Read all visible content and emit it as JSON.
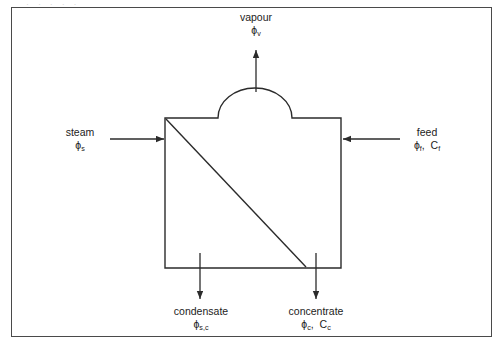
{
  "figure": {
    "clipped_caption_fragment": "·      ·        ·        ·    ·",
    "border_color": "#4a4a4a",
    "line_color": "#2b2b2b",
    "background": "#ffffff",
    "text_color": "#1c1c1c"
  },
  "diagram": {
    "type": "process-flow-evaporator",
    "streams": {
      "vapour": {
        "name": "vapour",
        "symbol_base": "ϕ",
        "symbol_sub": "v",
        "direction": "up-out",
        "arrow": {
          "x1": 256,
          "y1": 92,
          "x2": 256,
          "y2": 48
        }
      },
      "steam": {
        "name": "steam",
        "symbol_base": "ϕ",
        "symbol_sub": "s",
        "direction": "right-in",
        "arrow": {
          "x1": 110,
          "y1": 139,
          "x2": 165,
          "y2": 139
        }
      },
      "feed": {
        "name": "feed",
        "symbol_base": "ϕ",
        "symbol_sub": "f",
        "conc_base": "C",
        "conc_sub": "f",
        "direction": "left-in",
        "arrow": {
          "x1": 400,
          "y1": 139,
          "x2": 342,
          "y2": 139
        }
      },
      "condensate": {
        "name": "condensate",
        "symbol_base": "ϕ",
        "symbol_sub": "s,c",
        "direction": "down-out",
        "arrow": {
          "x1": 200,
          "y1": 253,
          "x2": 200,
          "y2": 300
        }
      },
      "concentrate": {
        "name": "concentrate",
        "symbol_base": "ϕ",
        "symbol_sub": "c",
        "conc_base": "C",
        "conc_sub": "c",
        "direction": "down-out",
        "arrow": {
          "x1": 316,
          "y1": 253,
          "x2": 316,
          "y2": 300
        }
      }
    },
    "vessel": {
      "body": {
        "left": 165,
        "right": 341,
        "top": 118,
        "bottom": 268
      },
      "dome": {
        "left": 218,
        "right": 292,
        "apex_y": 92
      },
      "diagonal": {
        "x1": 166,
        "y1": 119,
        "x2": 306,
        "y2": 267
      }
    }
  }
}
